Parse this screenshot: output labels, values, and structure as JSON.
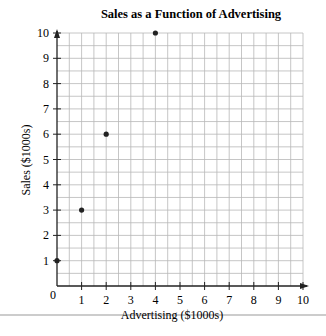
{
  "chart_data": {
    "type": "scatter",
    "title": "Sales as a Function of Advertising",
    "xlabel": "Advertising ($1000s)",
    "ylabel": "Sales ($1000s)",
    "xlim": [
      0,
      10
    ],
    "ylim": [
      0,
      10
    ],
    "xticks": [
      "0",
      "1",
      "2",
      "3",
      "4",
      "5",
      "6",
      "7",
      "8",
      "9",
      "10"
    ],
    "yticks": [
      "1",
      "2",
      "3",
      "4",
      "5",
      "6",
      "7",
      "8",
      "9",
      "10"
    ],
    "grid": true,
    "grid_minor_step": 0.5,
    "legend": null,
    "points": [
      {
        "x": 0,
        "y": 1
      },
      {
        "x": 1,
        "y": 3
      },
      {
        "x": 2,
        "y": 6
      },
      {
        "x": 4,
        "y": 10
      }
    ],
    "colors": {
      "grid": "#b8b8b8",
      "axis": "#222222",
      "point": "#222222",
      "rule": "#999999"
    }
  }
}
